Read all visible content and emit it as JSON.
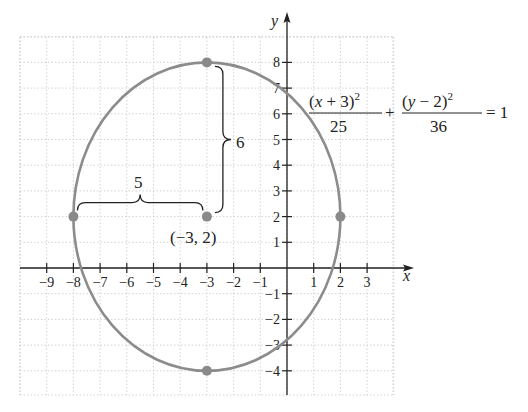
{
  "chart_data": {
    "type": "line",
    "title": "",
    "xlabel": "x",
    "ylabel": "y",
    "xlim": [
      -10,
      4
    ],
    "ylim": [
      -5,
      9
    ],
    "grid": true,
    "x_ticks": [
      -9,
      -8,
      -7,
      -6,
      -5,
      -4,
      -3,
      -2,
      -1,
      1,
      2,
      3
    ],
    "y_ticks": [
      -4,
      -3,
      -2,
      -1,
      1,
      2,
      3,
      4,
      5,
      6,
      7,
      8
    ],
    "x_tick_labels": [
      "−9",
      "−8",
      "−7",
      "−6",
      "−5",
      "−4",
      "−3",
      "−2",
      "−1",
      "1",
      "2",
      "3"
    ],
    "y_tick_labels": [
      "−4",
      "−3",
      "−2",
      "−1",
      "1",
      "2",
      "3",
      "4",
      "5",
      "6",
      "7",
      "8"
    ],
    "series": [
      {
        "name": "ellipse",
        "kind": "ellipse",
        "center": [
          -3,
          2
        ],
        "semi_axis_x": 5,
        "semi_axis_y": 6,
        "color": "#8c8c8c"
      }
    ],
    "points": [
      {
        "x": -3,
        "y": 8,
        "label": ""
      },
      {
        "x": -8,
        "y": 2,
        "label": ""
      },
      {
        "x": 2,
        "y": 2,
        "label": ""
      },
      {
        "x": -3,
        "y": -4,
        "label": ""
      },
      {
        "x": -3,
        "y": 2,
        "label": "(−3, 2)"
      }
    ],
    "annotations": [
      {
        "type": "brace-horizontal",
        "from": [
          -8,
          2
        ],
        "to": [
          -3,
          2
        ],
        "label": "5"
      },
      {
        "type": "brace-vertical",
        "from": [
          -3,
          8
        ],
        "to": [
          -3,
          2
        ],
        "label": "6"
      }
    ],
    "equation": {
      "term1_numerator": "(x + 3)",
      "term1_denominator": "25",
      "term2_numerator": "(y − 2)",
      "term2_denominator": "36",
      "exponent": "2",
      "plus": "+",
      "rhs": "= 1"
    }
  },
  "labels": {
    "x_axis": "x",
    "y_axis": "y",
    "center_point": "(−3, 2)",
    "brace_horizontal": "5",
    "brace_vertical": "6"
  },
  "colors": {
    "curve": "#8c8c8c",
    "point": "#8a8a8a",
    "axis": "#222222",
    "grid": "#c8c8c8"
  }
}
